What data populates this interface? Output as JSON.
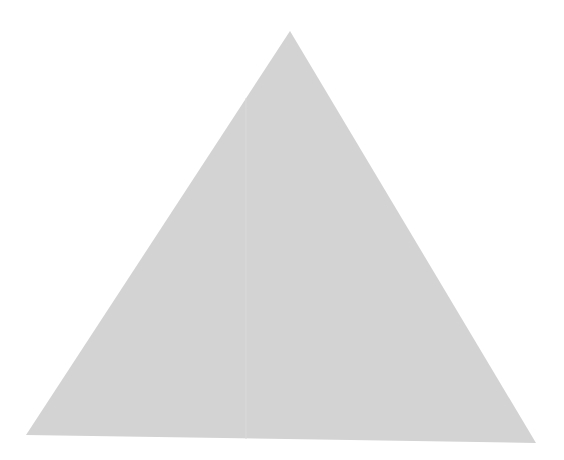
{
  "canvas": {
    "width": 564,
    "height": 460,
    "background": "#ffffff"
  },
  "shape": {
    "type": "triangle",
    "fill": "#d3d3d3",
    "points": "290,31 26,435 536,443",
    "seam": {
      "x1": 246,
      "y1": 98,
      "x2": 246,
      "y2": 439,
      "color": "#dadada"
    }
  }
}
